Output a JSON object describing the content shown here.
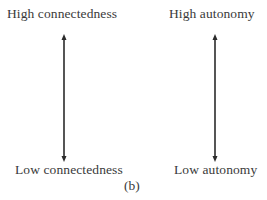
{
  "diagram": {
    "left_scale": {
      "top_label": "High connectedness",
      "bottom_label": "Low connectedness"
    },
    "right_scale": {
      "top_label": "High autonomy",
      "bottom_label": "Low autonomy"
    },
    "caption": "(b)",
    "colors": {
      "text": "#3a3a3a",
      "arrow": "#2b2b2b",
      "background": "#ffffff"
    }
  }
}
